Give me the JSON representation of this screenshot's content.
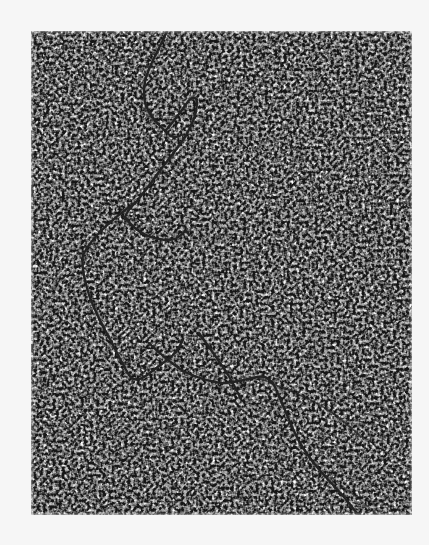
{
  "image": {
    "kind": "electron-micrograph",
    "subject": "filamentous molecular strand on grainy background",
    "background_color": "#f6f6f6",
    "frame": {
      "x": 31,
      "y": 31,
      "width": 381,
      "height": 484
    },
    "texture_colors": {
      "dark": "#1a1a1a",
      "mid": "#8c8c8c",
      "light": "#e6e6e6"
    },
    "strand_color": "#232323"
  }
}
